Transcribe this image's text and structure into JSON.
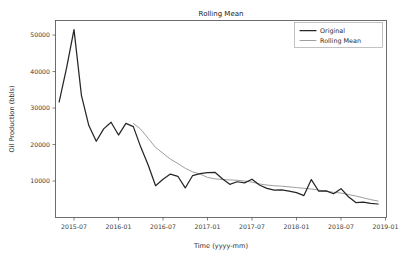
{
  "chart_data": {
    "type": "line",
    "title": "Rolling Mean",
    "xlabel": "Time (yyyy-mm)",
    "ylabel": "Oil Production (bbls)",
    "grid": false,
    "legend_position": "top-right",
    "xlim": [
      "2015-04",
      "2019-01"
    ],
    "ylim": [
      0,
      54000
    ],
    "ytick_labels": [
      "10000",
      "20000",
      "30000",
      "40000",
      "50000"
    ],
    "ytick_values": [
      10000,
      20000,
      30000,
      40000,
      50000
    ],
    "xtick_labels": [
      "2015-07",
      "2016-01",
      "2016-07",
      "2017-01",
      "2017-07",
      "2018-01",
      "2018-07",
      "2019-01"
    ],
    "xtick_values": [
      "2015-07",
      "2016-01",
      "2016-07",
      "2017-01",
      "2017-07",
      "2018-01",
      "2018-07",
      "2019-01"
    ],
    "x": [
      "2015-05",
      "2015-06",
      "2015-07",
      "2015-08",
      "2015-09",
      "2015-10",
      "2015-11",
      "2015-12",
      "2016-01",
      "2016-02",
      "2016-03",
      "2016-04",
      "2016-05",
      "2016-06",
      "2016-07",
      "2016-08",
      "2016-09",
      "2016-10",
      "2016-11",
      "2016-12",
      "2017-01",
      "2017-02",
      "2017-03",
      "2017-04",
      "2017-05",
      "2017-06",
      "2017-07",
      "2017-08",
      "2017-09",
      "2017-10",
      "2017-11",
      "2017-12",
      "2018-01",
      "2018-02",
      "2018-03",
      "2018-04",
      "2018-05",
      "2018-06",
      "2018-07",
      "2018-08",
      "2018-09",
      "2018-10",
      "2018-11",
      "2018-12"
    ],
    "series": [
      {
        "name": "Original",
        "color": "#262626",
        "values": [
          31700,
          41000,
          51500,
          33500,
          25200,
          20900,
          24300,
          26100,
          22600,
          25800,
          24900,
          19300,
          14400,
          8700,
          10500,
          11900,
          11300,
          8100,
          11500,
          12000,
          12300,
          12400,
          10600,
          9100,
          9800,
          9500,
          10500,
          8900,
          8000,
          7500,
          7600,
          7200,
          6800,
          6000,
          10400,
          7200,
          7300,
          6500,
          7900,
          5700,
          4100,
          4200,
          3900,
          3700
        ]
      },
      {
        "name": "Rolling Mean",
        "color": "#8c8c8c",
        "values": [
          null,
          null,
          null,
          null,
          null,
          null,
          null,
          null,
          null,
          null,
          25800,
          24200,
          21700,
          19200,
          17600,
          16000,
          14800,
          13500,
          12500,
          11900,
          11000,
          10600,
          10400,
          10300,
          10200,
          10000,
          9700,
          9200,
          8900,
          8700,
          8600,
          8400,
          8200,
          8000,
          7800,
          7500,
          7200,
          6900,
          6700,
          6300,
          5900,
          5400,
          4900,
          4500
        ]
      }
    ]
  },
  "legend": {
    "entries": [
      {
        "label": "Original"
      },
      {
        "label": "Rolling Mean"
      }
    ]
  }
}
